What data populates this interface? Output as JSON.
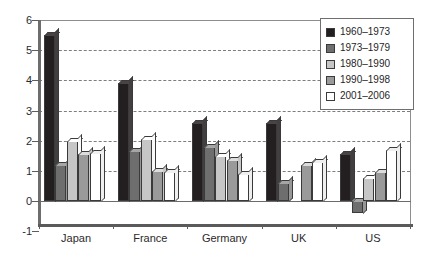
{
  "chart_data": {
    "type": "bar",
    "title": "",
    "subtitle": "",
    "xlabel": "",
    "ylabel": "",
    "ylim": [
      -1,
      6
    ],
    "yticks": [
      "6",
      "5",
      "4",
      "3",
      "2",
      "1",
      "0",
      "-1"
    ],
    "ytick_values": [
      6,
      5,
      4,
      3,
      2,
      1,
      0,
      -1
    ],
    "grid": true,
    "grid_style": "dashed-horizontal",
    "legend_position": "top-right",
    "categories": [
      "Japan",
      "France",
      "Germany",
      "UK",
      "US"
    ],
    "series": [
      {
        "name": "1960–1973",
        "color": "#231f20",
        "values": [
          5.5,
          3.9,
          2.6,
          2.6,
          1.55
        ]
      },
      {
        "name": "1973–1979",
        "color": "#6e6e6e",
        "values": [
          1.2,
          1.65,
          1.8,
          0.6,
          -0.4
        ]
      },
      {
        "name": "1980–1990",
        "color": "#c6c6c6",
        "values": [
          2.0,
          2.05,
          1.5,
          0.0,
          0.75
        ]
      },
      {
        "name": "1990–1998",
        "color": "#9a9a9a",
        "values": [
          1.55,
          1.0,
          1.35,
          1.2,
          0.95
        ]
      },
      {
        "name": "2001–2006",
        "color": "#ffffff",
        "values": [
          1.6,
          0.95,
          0.9,
          1.3,
          1.7
        ]
      }
    ]
  },
  "legend": {
    "items": [
      {
        "label": "1960–1973",
        "color": "#231f20"
      },
      {
        "label": "1973–1979",
        "color": "#6e6e6e"
      },
      {
        "label": "1980–1990",
        "color": "#c6c6c6"
      },
      {
        "label": "1990–1998",
        "color": "#9a9a9a"
      },
      {
        "label": "2001–2006",
        "color": "#ffffff"
      }
    ]
  },
  "axes": {
    "y_labels": [
      "6",
      "5",
      "4",
      "3",
      "2",
      "1",
      "0",
      "-1"
    ],
    "x_labels": [
      "Japan",
      "France",
      "Germany",
      "UK",
      "US"
    ]
  },
  "colors": {
    "frame": "#8e8e8e",
    "axis": "#5d5d5d",
    "grid": "#7d7d7d",
    "bar_outline": "#3a3a3a",
    "text": "#2b2b2b",
    "background": "#ffffff"
  }
}
